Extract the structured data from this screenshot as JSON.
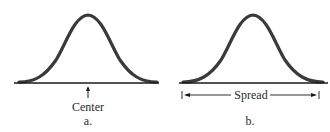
{
  "figure": {
    "panels": [
      {
        "id": "a",
        "caption": "a.",
        "annotation": "Center",
        "shape": "normal-curve",
        "indicator": "upward arrow at mean"
      },
      {
        "id": "b",
        "caption": "b.",
        "annotation": "Spread",
        "shape": "normal-curve",
        "indicator": "double-headed arrow spanning the curve width"
      }
    ],
    "colors": {
      "curve": "#3a3a3a",
      "axis": "#1a1a1a",
      "text": "#2a2a2a"
    }
  }
}
